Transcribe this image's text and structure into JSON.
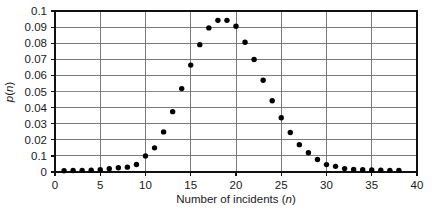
{
  "chart_data": {
    "type": "scatter",
    "title": "",
    "xlabel": "Number of incidents (n)",
    "xlabel_plain": "Number of incidents",
    "xlabel_variable": "n",
    "ylabel": "p(n)",
    "ylabel_plain": "p",
    "ylabel_variable": "n",
    "xlim": [
      0,
      40
    ],
    "ylim": [
      0,
      0.1
    ],
    "grid": true,
    "legend": false,
    "marker": "filled-circle",
    "marker_color": "#000000",
    "xticks": [
      0,
      5,
      10,
      15,
      20,
      25,
      30,
      35,
      40
    ],
    "xtick_labels": [
      "0",
      "5",
      "10",
      "15",
      "20",
      "25",
      "30",
      "35",
      "40"
    ],
    "yticks": [
      0,
      0.01,
      0.02,
      0.03,
      0.04,
      0.05,
      0.06,
      0.07,
      0.08,
      0.09,
      0.1
    ],
    "ytick_labels": [
      "0",
      "0.1",
      "0.02",
      "0.03",
      "0.04",
      "0.05",
      "0.06",
      "0.07",
      "0.08",
      "0.09",
      "0.1"
    ],
    "x": [
      1,
      2,
      3,
      4,
      5,
      6,
      7,
      8,
      9,
      10,
      11,
      12,
      13,
      14,
      15,
      16,
      17,
      18,
      19,
      20,
      21,
      22,
      23,
      24,
      25,
      26,
      27,
      28,
      29,
      30,
      31,
      32,
      33,
      34,
      35,
      36,
      37,
      38
    ],
    "values": [
      0.0008,
      0.0009,
      0.001,
      0.0011,
      0.0014,
      0.002,
      0.0026,
      0.003,
      0.0047,
      0.01,
      0.015,
      0.0249,
      0.0375,
      0.0518,
      0.0664,
      0.0791,
      0.0895,
      0.0942,
      0.0942,
      0.0905,
      0.0806,
      0.0699,
      0.057,
      0.0443,
      0.0337,
      0.0245,
      0.017,
      0.012,
      0.0078,
      0.0046,
      0.0035,
      0.0021,
      0.0016,
      0.0014,
      0.0012,
      0.0011,
      0.001,
      0.001
    ]
  },
  "figure": {
    "background_color": "#ffffff",
    "grid_color": "#6b6b6b",
    "frame_color": "#111111",
    "text_color": "#1a1a1a"
  }
}
